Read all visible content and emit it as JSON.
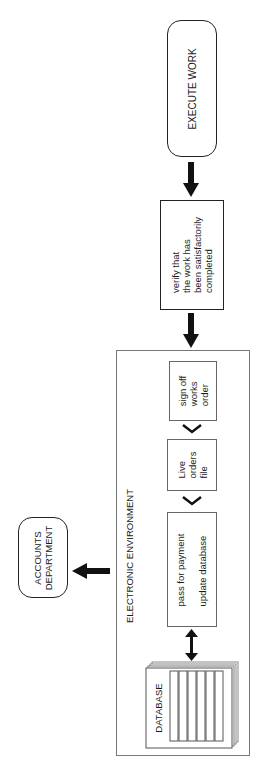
{
  "diagram": {
    "nodes": {
      "execute_work": {
        "label_lines": [
          "EXECUTE WORK"
        ]
      },
      "verify": {
        "label_lines": [
          "verify that",
          "the work has",
          "been satisfactorily",
          "completed"
        ]
      },
      "sign_off": {
        "label_lines": [
          "sign off",
          "works",
          "order"
        ]
      },
      "live_orders": {
        "label_lines": [
          "Live",
          "orders",
          "file"
        ]
      },
      "pass_payment": {
        "label_lines": [
          "pass for payment",
          "update database"
        ]
      },
      "database": {
        "label": "DATABASE"
      },
      "accounts": {
        "label_lines": [
          "ACCOUNTS",
          "DEPARTMENT"
        ]
      }
    },
    "groups": {
      "electronic_environment": {
        "label": "ELECTRONIC ENVIRONMENT"
      }
    },
    "edges": [
      {
        "from": "execute_work",
        "to": "verify",
        "style": "thick-arrow"
      },
      {
        "from": "verify",
        "to": "electronic_environment",
        "style": "thick-arrow"
      },
      {
        "from": "sign_off",
        "to": "live_orders",
        "style": "chevron"
      },
      {
        "from": "live_orders",
        "to": "pass_payment",
        "style": "chevron"
      },
      {
        "from": "pass_payment",
        "to": "database",
        "style": "double-arrow"
      },
      {
        "from": "electronic_environment",
        "to": "accounts",
        "style": "thick-arrow"
      }
    ],
    "colors": {
      "stroke": "#222222",
      "group_border": "#777777",
      "background": "#ffffff"
    }
  }
}
